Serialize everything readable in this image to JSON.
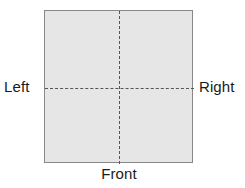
{
  "diagram": {
    "type": "orientation-reference-square",
    "shape": {
      "name": "square",
      "fill_color": "#e6e6e6",
      "border_color": "#888888"
    },
    "axes": {
      "style": "dashed",
      "color": "#555555",
      "vertical_present": true,
      "horizontal_present": true
    },
    "labels": {
      "left": "Left",
      "right": "Right",
      "front": "Front"
    }
  }
}
